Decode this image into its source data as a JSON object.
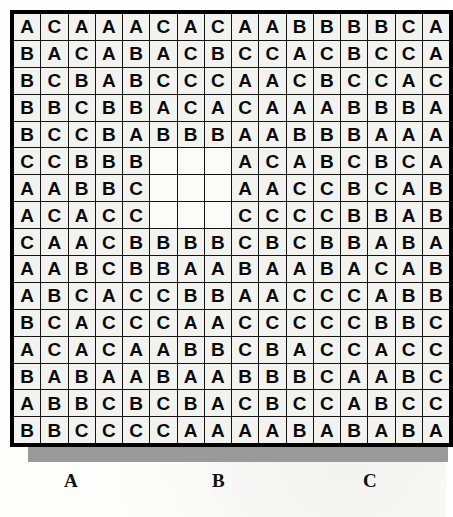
{
  "grid": {
    "rows": 16,
    "cols": 16,
    "blank_cell_marker": "",
    "cells": [
      [
        "A",
        "C",
        "A",
        "A",
        "A",
        "C",
        "A",
        "C",
        "A",
        "A",
        "B",
        "B",
        "B",
        "B",
        "C",
        "A"
      ],
      [
        "B",
        "A",
        "C",
        "A",
        "B",
        "A",
        "C",
        "B",
        "C",
        "C",
        "A",
        "C",
        "B",
        "C",
        "C",
        "A"
      ],
      [
        "B",
        "C",
        "B",
        "A",
        "B",
        "C",
        "C",
        "C",
        "A",
        "A",
        "C",
        "B",
        "C",
        "C",
        "A",
        "C"
      ],
      [
        "B",
        "B",
        "C",
        "B",
        "B",
        "A",
        "C",
        "A",
        "C",
        "A",
        "A",
        "A",
        "B",
        "B",
        "B",
        "A"
      ],
      [
        "B",
        "C",
        "C",
        "B",
        "A",
        "B",
        "B",
        "B",
        "A",
        "A",
        "B",
        "B",
        "B",
        "A",
        "A",
        "A"
      ],
      [
        "C",
        "C",
        "B",
        "B",
        "B",
        "",
        "",
        "",
        "A",
        "C",
        "A",
        "B",
        "C",
        "B",
        "C",
        "A"
      ],
      [
        "A",
        "A",
        "B",
        "B",
        "C",
        "",
        "",
        "",
        "A",
        "A",
        "C",
        "C",
        "B",
        "C",
        "A",
        "B"
      ],
      [
        "A",
        "C",
        "A",
        "C",
        "C",
        "",
        "",
        "",
        "C",
        "C",
        "C",
        "C",
        "B",
        "B",
        "A",
        "B"
      ],
      [
        "C",
        "A",
        "A",
        "C",
        "B",
        "B",
        "B",
        "B",
        "C",
        "B",
        "C",
        "B",
        "B",
        "A",
        "B",
        "A"
      ],
      [
        "A",
        "A",
        "B",
        "C",
        "B",
        "B",
        "A",
        "A",
        "B",
        "A",
        "A",
        "B",
        "A",
        "C",
        "A",
        "B"
      ],
      [
        "A",
        "B",
        "C",
        "A",
        "C",
        "C",
        "B",
        "B",
        "A",
        "A",
        "C",
        "C",
        "C",
        "A",
        "B",
        "B"
      ],
      [
        "B",
        "C",
        "A",
        "C",
        "C",
        "C",
        "A",
        "A",
        "C",
        "C",
        "C",
        "C",
        "C",
        "B",
        "B",
        "C"
      ],
      [
        "A",
        "C",
        "A",
        "C",
        "A",
        "A",
        "B",
        "B",
        "C",
        "B",
        "A",
        "C",
        "C",
        "A",
        "C",
        "C"
      ],
      [
        "B",
        "A",
        "B",
        "A",
        "A",
        "B",
        "A",
        "A",
        "B",
        "B",
        "B",
        "C",
        "A",
        "A",
        "B",
        "C"
      ],
      [
        "A",
        "B",
        "B",
        "C",
        "B",
        "C",
        "B",
        "A",
        "C",
        "B",
        "C",
        "C",
        "A",
        "B",
        "C",
        "C"
      ],
      [
        "B",
        "B",
        "C",
        "C",
        "C",
        "C",
        "A",
        "A",
        "A",
        "A",
        "B",
        "A",
        "B",
        "A",
        "B",
        "A"
      ]
    ]
  },
  "axis_labels": {
    "a": "A",
    "b": "B",
    "c": "C"
  },
  "colors": {
    "cell_fill": "#f2f2ef",
    "cell_border": "#141414",
    "grid_border": "#000000",
    "shadow": "#9a9a9a",
    "text": "#0a0a0a",
    "page": "#fdfdfb"
  }
}
